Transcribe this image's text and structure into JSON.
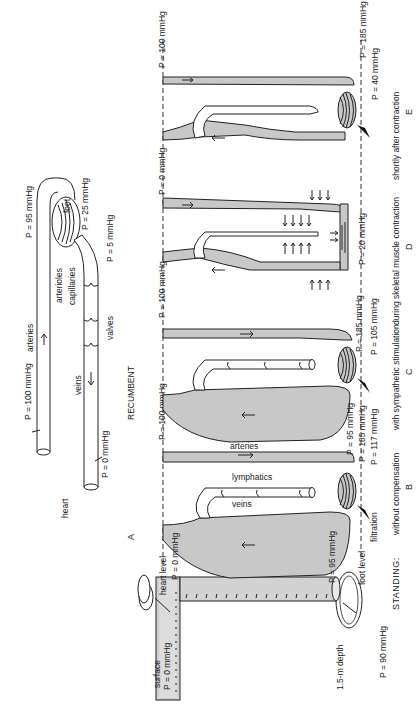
{
  "figure": {
    "orientation": "rotated 90deg counter-clockwise",
    "panel_a": {
      "letter": "A",
      "caption": "RECUMBENT",
      "labels": {
        "heart": "heart",
        "arteries": "arteries",
        "veins": "veins",
        "arterioles": "arterioles",
        "capillaries": "capillaries",
        "valves": "valves",
        "foot": "foot"
      },
      "pressures": {
        "artery_heart": "P = 100 mmHg",
        "vein_heart": "P = 0 mmHg",
        "arteriole_foot": "P = 95 mmHg",
        "capillaries_foot": "P = 25 mmHg",
        "venule_foot": "P = 5 mmHg"
      }
    },
    "water_column": {
      "surface_label": "surface",
      "surface_pressure": "P = 0 mmHg",
      "depth_label": "1.5-m depth",
      "depth_pressure": "P = 90 mmHg"
    },
    "reference_lines": {
      "heart_level": "heart level",
      "foot_level": "foot level"
    },
    "standing_label": "STANDING:",
    "panels": [
      {
        "letter": "B",
        "caption": "without compensation",
        "labels": {
          "arteries": "arteries",
          "lymphatics": "lymphatics",
          "veins": "veins",
          "filtration": "filtration"
        },
        "pressures": {
          "artery_heart": "P = 100 mmHg",
          "vein_heart": "P = 0 mmHg",
          "vein_foot": "P = 95 mmHg",
          "artery_foot": "P = 185 mmHg",
          "capillary_foot": "P = 117 mmHg"
        }
      },
      {
        "letter": "C",
        "caption": "with sympathetic stimulation",
        "pressures": {
          "artery_heart": "P = 100 mmHg",
          "vein_foot": "P = 95 mmHg",
          "artery_foot": "P = 185 mmHg",
          "capillary_foot": "P = 105 mmHg"
        }
      },
      {
        "letter": "D",
        "caption": "during skeletal muscle contraction",
        "pressures": {
          "vein_foot": "P = 20 mmHg"
        }
      },
      {
        "letter": "E",
        "caption": "shortly after contraction",
        "pressures": {
          "artery_heart": "P = 100 mmHg",
          "vein_heart": "P = 0 mmHg",
          "artery_foot": "P = 185 mmHg",
          "capillary_foot": "P = 40 mmHg"
        }
      }
    ]
  }
}
